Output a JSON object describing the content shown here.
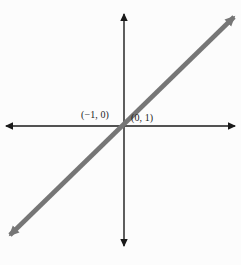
{
  "figure": {
    "background_color": "#fcfcfc",
    "width": 241,
    "height": 265
  },
  "axes": {
    "color": "#1a1a1a",
    "stroke_width": 1.4,
    "x_axis": {
      "name": "x-axis",
      "y_position": 126,
      "from_x": 6,
      "to_x": 235,
      "arrowheads": "both"
    },
    "y_axis": {
      "name": "y-axis",
      "x_position": 124,
      "from_y": 14,
      "to_y": 246,
      "arrowheads": "both"
    },
    "origin": {
      "x": 124,
      "y": 126
    }
  },
  "line": {
    "name": "graphed-line",
    "color": "#767676",
    "stroke_width": 4.6,
    "arrowheads": "both",
    "start": {
      "x": 10,
      "y": 235
    },
    "end": {
      "x": 234,
      "y": 17
    }
  },
  "labels": {
    "x_intercept": "(−1, 0)",
    "y_intercept": "(0, 1)"
  },
  "chart_data": {
    "type": "line",
    "title": "",
    "xlabel": "",
    "ylabel": "",
    "grid": false,
    "legend": "none",
    "xlim": [
      -5,
      5
    ],
    "ylim": [
      -5,
      5
    ],
    "annotations": [
      {
        "text": "(−1, 0)",
        "x": -1,
        "y": 0
      },
      {
        "text": "(0, 1)",
        "x": 0,
        "y": 1
      }
    ],
    "series": [
      {
        "name": "line",
        "slope": 1,
        "intercept": 0,
        "color": "#767676",
        "x": [
          -5,
          5
        ],
        "values": [
          -5,
          5
        ]
      }
    ]
  }
}
